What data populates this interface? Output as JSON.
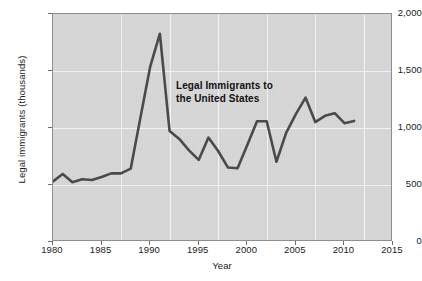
{
  "chart_data": {
    "type": "line",
    "title": "",
    "annotation": "Legal Immigrants to\nthe United States",
    "annotation_line1": "Legal Immigrants to",
    "annotation_line2": "the United States",
    "xlabel": "Year",
    "ylabel": "Legal immigrants (thousands)",
    "xlim": [
      1980,
      2015
    ],
    "ylim": [
      0,
      2000
    ],
    "xticks": [
      1980,
      1985,
      1990,
      1995,
      2000,
      2005,
      2010,
      2015
    ],
    "xticklabels": [
      "1980",
      "1985",
      "1990",
      "1995",
      "2000",
      "2005",
      "2010",
      "2015"
    ],
    "yticks": [
      0,
      500,
      1000,
      1500,
      2000
    ],
    "yticklabels": [
      "0",
      "500",
      "1,000",
      "1,500",
      "2,000"
    ],
    "grid": true,
    "legend": "none",
    "series": [
      {
        "name": "Legal Immigrants to the United States",
        "color": "#4a4a4a",
        "x": [
          1980,
          1981,
          1982,
          1983,
          1984,
          1985,
          1986,
          1987,
          1988,
          1989,
          1990,
          1991,
          1992,
          1993,
          1994,
          1995,
          1996,
          1997,
          1998,
          1999,
          2000,
          2001,
          2002,
          2003,
          2004,
          2005,
          2006,
          2007,
          2008,
          2009,
          2010,
          2011
        ],
        "values": [
          531,
          597,
          524,
          550,
          544,
          570,
          602,
          602,
          643,
          1091,
          1536,
          1827,
          974,
          904,
          804,
          720,
          916,
          798,
          654,
          647,
          850,
          1059,
          1059,
          704,
          958,
          1122,
          1266,
          1052,
          1107,
          1130,
          1042,
          1062
        ]
      }
    ]
  },
  "axis_style": {
    "plot_background": "#d6d6d6",
    "grid_color": "#f2f2f2",
    "frame_color": "#8e8e8e",
    "line_color": "#4a4a4a",
    "text_color": "#1b1b1b"
  }
}
